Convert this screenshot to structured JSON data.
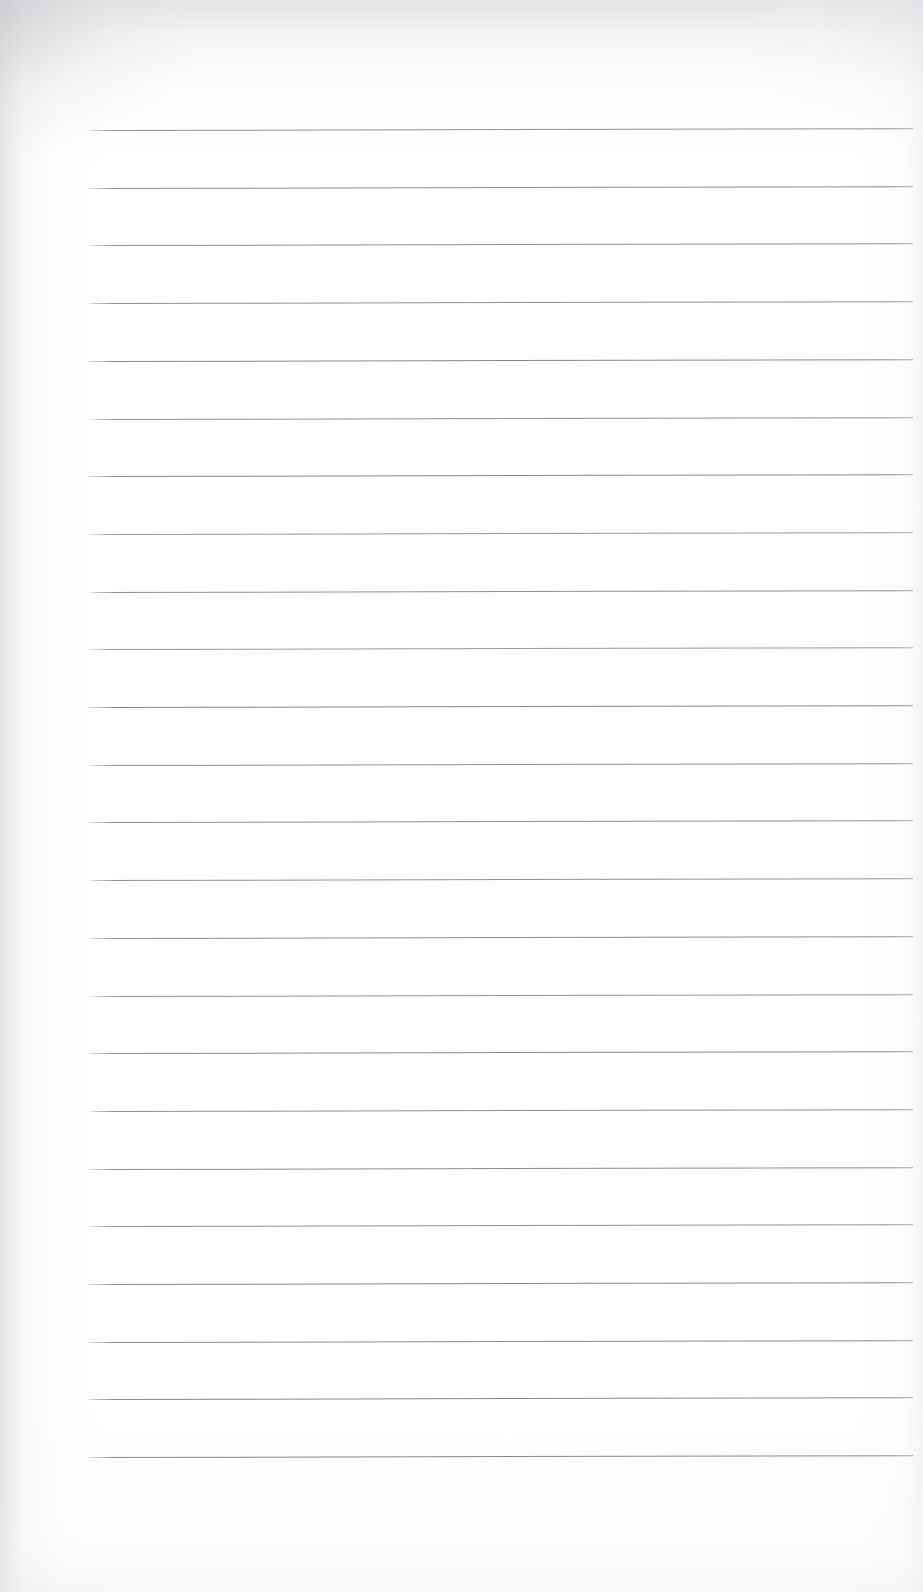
{
  "document": {
    "kind": "blank-ruled-notebook-page",
    "title": "Blank Ruled Notebook Page",
    "page_width": 923,
    "page_height": 1592,
    "background_color": "#ffffff",
    "paper_tint": "#fdfdfd",
    "has_text_content": false,
    "text_content": "",
    "has_margin_rule": false,
    "has_header": false,
    "has_footer": false,
    "has_page_number": false,
    "visible_text_items": []
  },
  "ruling": {
    "line_count": 24,
    "first_line_y": 130,
    "last_line_y": 1457,
    "line_spacing": 57.7,
    "line_left_x": 89,
    "line_right_x": 913,
    "line_length": 824,
    "line_color": "#8a8a8a",
    "line_thickness": 1.2,
    "tilt_degrees": -0.12,
    "left_margin": 89,
    "right_margin": 10,
    "top_margin": 130,
    "bottom_margin": 135,
    "lines": [
      {
        "index": 1,
        "y": 130,
        "color": "#8c8c8c",
        "thickness": 1.2,
        "opacity": 0.95
      },
      {
        "index": 2,
        "y": 187.7,
        "color": "#888888",
        "thickness": 1.2,
        "opacity": 0.97
      },
      {
        "index": 3,
        "y": 245.4,
        "color": "#898989",
        "thickness": 1.2,
        "opacity": 0.96
      },
      {
        "index": 4,
        "y": 303.1,
        "color": "#8a8a8a",
        "thickness": 1.2,
        "opacity": 0.95
      },
      {
        "index": 5,
        "y": 360.8,
        "color": "#878787",
        "thickness": 1.2,
        "opacity": 0.98
      },
      {
        "index": 6,
        "y": 418.5,
        "color": "#8b8b8b",
        "thickness": 1.2,
        "opacity": 0.94
      },
      {
        "index": 7,
        "y": 476.2,
        "color": "#878787",
        "thickness": 1.3,
        "opacity": 0.98
      },
      {
        "index": 8,
        "y": 533.9,
        "color": "#8d8d8d",
        "thickness": 1.1,
        "opacity": 0.9
      },
      {
        "index": 9,
        "y": 591.6,
        "color": "#8a8a8a",
        "thickness": 1.2,
        "opacity": 0.95
      },
      {
        "index": 10,
        "y": 649.3,
        "color": "#8e8e8e",
        "thickness": 1.2,
        "opacity": 0.9
      },
      {
        "index": 11,
        "y": 707.0,
        "color": "#848484",
        "thickness": 1.3,
        "opacity": 0.99
      },
      {
        "index": 12,
        "y": 764.7,
        "color": "#8a8a8a",
        "thickness": 1.2,
        "opacity": 0.95
      },
      {
        "index": 13,
        "y": 822.4,
        "color": "#898989",
        "thickness": 1.2,
        "opacity": 0.96
      },
      {
        "index": 14,
        "y": 880.1,
        "color": "#8b8b8b",
        "thickness": 1.2,
        "opacity": 0.94
      },
      {
        "index": 15,
        "y": 937.8,
        "color": "#888888",
        "thickness": 1.2,
        "opacity": 0.97
      },
      {
        "index": 16,
        "y": 995.5,
        "color": "#8c8c8c",
        "thickness": 1.2,
        "opacity": 0.93
      },
      {
        "index": 17,
        "y": 1053.2,
        "color": "#878787",
        "thickness": 1.2,
        "opacity": 0.98
      },
      {
        "index": 18,
        "y": 1110.9,
        "color": "#8a8a8a",
        "thickness": 1.2,
        "opacity": 0.95
      },
      {
        "index": 19,
        "y": 1168.6,
        "color": "#888888",
        "thickness": 1.2,
        "opacity": 0.97
      },
      {
        "index": 20,
        "y": 1226.3,
        "color": "#8b8b8b",
        "thickness": 1.2,
        "opacity": 0.94
      },
      {
        "index": 21,
        "y": 1284.0,
        "color": "#868686",
        "thickness": 1.3,
        "opacity": 0.98
      },
      {
        "index": 22,
        "y": 1341.7,
        "color": "#878787",
        "thickness": 1.3,
        "opacity": 0.98
      },
      {
        "index": 23,
        "y": 1399.4,
        "color": "#858585",
        "thickness": 1.3,
        "opacity": 0.99
      },
      {
        "index": 24,
        "y": 1457.1,
        "color": "#878787",
        "thickness": 1.3,
        "opacity": 0.98
      }
    ]
  }
}
